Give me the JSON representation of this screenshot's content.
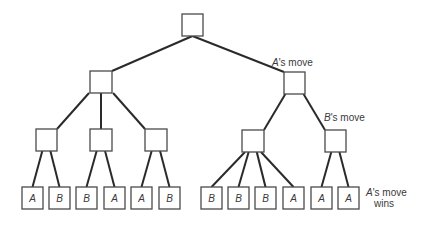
{
  "diagram": {
    "type": "game-tree",
    "annotations": {
      "level1": {
        "player": "A",
        "suffix": "'s move"
      },
      "level2": {
        "player": "B",
        "suffix": "'s move"
      },
      "leaves_line1": {
        "player": "A",
        "suffix": "'s move"
      },
      "leaves_line2": "wins"
    },
    "nodes": {
      "root": {
        "x": 182,
        "y": 14,
        "w": 21,
        "h": 22
      },
      "level1": [
        {
          "x": 90,
          "y": 71,
          "w": 22,
          "h": 22
        },
        {
          "x": 284,
          "y": 72,
          "w": 21,
          "h": 22
        }
      ],
      "level2": [
        {
          "x": 36,
          "y": 129,
          "w": 21,
          "h": 22,
          "parent": 0
        },
        {
          "x": 90,
          "y": 129,
          "w": 22,
          "h": 22,
          "parent": 0
        },
        {
          "x": 145,
          "y": 129,
          "w": 22,
          "h": 22,
          "parent": 0
        },
        {
          "x": 242,
          "y": 130,
          "w": 22,
          "h": 22,
          "parent": 1
        },
        {
          "x": 325,
          "y": 130,
          "w": 21,
          "h": 22,
          "parent": 1
        }
      ],
      "leaves": [
        {
          "label": "A",
          "x": 22,
          "parent": 0
        },
        {
          "label": "B",
          "x": 49,
          "parent": 0
        },
        {
          "label": "B",
          "x": 76,
          "parent": 1
        },
        {
          "label": "A",
          "x": 104,
          "parent": 1
        },
        {
          "label": "A",
          "x": 131,
          "parent": 2
        },
        {
          "label": "B",
          "x": 159,
          "parent": 2
        },
        {
          "label": "B",
          "x": 201,
          "parent": 3
        },
        {
          "label": "B",
          "x": 228,
          "parent": 3
        },
        {
          "label": "B",
          "x": 255,
          "parent": 3
        },
        {
          "label": "A",
          "x": 283,
          "parent": 3
        },
        {
          "label": "A",
          "x": 311,
          "parent": 4
        },
        {
          "label": "A",
          "x": 338,
          "parent": 4
        }
      ],
      "leaf_y": 187,
      "leaf_w": 21,
      "leaf_h": 22
    },
    "colors": {
      "edge": "#2a2a2a",
      "node_stroke": "#4a4a4a",
      "text": "#3a3a3a",
      "background": "#ffffff"
    }
  }
}
